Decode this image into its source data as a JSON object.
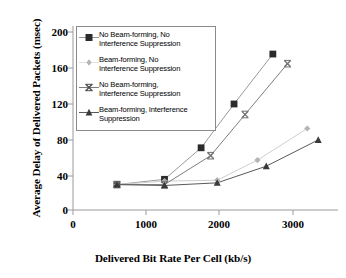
{
  "chart_data": {
    "type": "line",
    "title": "",
    "xlabel": "Delivered Bit Rate Per Cell (kb/s)",
    "ylabel": "Average Delay of Delivered Packets (msec)",
    "xlim": [
      0,
      3620
    ],
    "ylim": [
      0,
      210
    ],
    "xticks": [
      0,
      1000,
      2000,
      3000
    ],
    "xtick_labels": [
      "0",
      "1000",
      "2000",
      "3000"
    ],
    "yticks": [
      0,
      40,
      80,
      120,
      160,
      200
    ],
    "ytick_labels": [
      "0",
      "40",
      "80",
      "120",
      "160",
      "200"
    ],
    "grid": false,
    "legend_position": "upper left (inside axes)",
    "series": [
      {
        "name": "No Beam-forming, No Interference Suppression",
        "marker": "filled-square",
        "color": "#2b2b2b",
        "line_color": "#9a9a9a",
        "x": [
          600,
          1250,
          1750,
          2200,
          2730
        ],
        "y": [
          29,
          35,
          71,
          121,
          178
        ]
      },
      {
        "name": "Beam-forming, No Interference Suppression",
        "marker": "small-diamond",
        "color": "#b4b4b4",
        "line_color": "#cfcfcf",
        "x": [
          600,
          1250,
          1970,
          2520,
          3200
        ],
        "y": [
          29,
          33,
          34,
          57,
          93
        ]
      },
      {
        "name": "No Beam-forming, Interference Suppression",
        "marker": "cross-x",
        "color": "#6e6e6e",
        "line_color": "#7d7d7d",
        "x": [
          600,
          1250,
          1880,
          2350,
          2930
        ],
        "y": [
          29,
          29,
          62,
          109,
          167
        ]
      },
      {
        "name": "Beam-forming, Interference Suppression",
        "marker": "filled-triangle",
        "color": "#3a3a3a",
        "line_color": "#5a5a5a",
        "x": [
          600,
          1250,
          1970,
          2640,
          3350
        ],
        "y": [
          29,
          28,
          31,
          50,
          80
        ]
      }
    ]
  },
  "legend": {
    "items": [
      {
        "line1": "No Beam-forming, No",
        "line2": "Interference Suppression",
        "marker": "filled-square"
      },
      {
        "line1": "Beam-forming, No",
        "line2": "Interference Suppression",
        "marker": "small-diamond"
      },
      {
        "line1": "No Beam-forming,",
        "line2": "Interference Suppression",
        "marker": "cross-x"
      },
      {
        "line1": "Beam-forming, Interference",
        "line2": "Suppression",
        "marker": "filled-triangle"
      }
    ]
  },
  "axes": {
    "ylabel": "Average Delay of Delivered Packets (msec)",
    "xlabel": "Delivered Bit Rate Per Cell (kb/s)"
  },
  "colors": {
    "axis": "#9a9a9a",
    "text": "#000000",
    "series_dark": "#2b2b2b",
    "series_light": "#b4b4b4",
    "series_mid": "#6e6e6e",
    "legend_border": "#8a8a8a"
  }
}
